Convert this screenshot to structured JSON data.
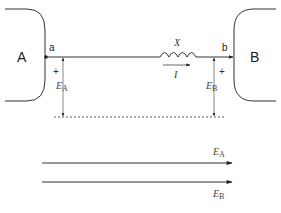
{
  "diagram": {
    "systems": [
      {
        "id": "A",
        "label": "A",
        "node_label": "a"
      },
      {
        "id": "B",
        "label": "B",
        "node_label": "b"
      }
    ],
    "reactance": {
      "label": "X"
    },
    "current": {
      "label": "I"
    },
    "voltages": [
      {
        "id": "EA",
        "symbol": "E",
        "subscript": "A",
        "polarity": "+"
      },
      {
        "id": "EB",
        "symbol": "E",
        "subscript": "B",
        "polarity": "+"
      }
    ],
    "phasors": [
      {
        "symbol": "E",
        "subscript": "A"
      },
      {
        "symbol": "E",
        "subscript": "B"
      }
    ]
  }
}
